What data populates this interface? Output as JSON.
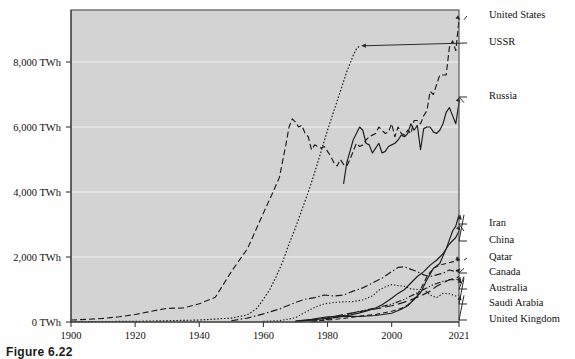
{
  "figure": {
    "caption": "Figure 6.22",
    "background": "#d3d3d3",
    "axis_color": "#3a3a3a",
    "grid_color": "#f2f2f2",
    "line_color": "#1c1c1c"
  },
  "chart_data": {
    "type": "line",
    "title": "",
    "subtitle": "",
    "xlabel": "",
    "ylabel": "",
    "xlim": [
      1900,
      2021
    ],
    "ylim": [
      0,
      9600
    ],
    "grid": true,
    "legend_position": "right-annotations",
    "x_tick_labels": [
      "1900",
      "1920",
      "1940",
      "1960",
      "1980",
      "2000",
      "2021"
    ],
    "x_ticks": [
      1900,
      1920,
      1940,
      1960,
      1980,
      2000,
      2021
    ],
    "y_tick_labels": [
      "0 TWh",
      "2,000 TWh",
      "4,000 TWh",
      "6,000 TWh",
      "8,000 TWh"
    ],
    "y_ticks": [
      0,
      2000,
      4000,
      6000,
      8000
    ],
    "series": [
      {
        "name": "United States",
        "label": "United States",
        "style": "dashed",
        "dash": "6,3",
        "width": 1.2,
        "x": [
          1900,
          1905,
          1910,
          1915,
          1920,
          1925,
          1930,
          1935,
          1940,
          1945,
          1950,
          1955,
          1960,
          1963,
          1965,
          1967,
          1968,
          1969,
          1970,
          1971,
          1972,
          1973,
          1974,
          1975,
          1976,
          1977,
          1978,
          1979,
          1980,
          1981,
          1982,
          1983,
          1984,
          1985,
          1986,
          1987,
          1988,
          1989,
          1990,
          1991,
          1992,
          1993,
          1994,
          1995,
          1996,
          1997,
          1998,
          1999,
          2000,
          2001,
          2002,
          2003,
          2004,
          2005,
          2006,
          2007,
          2008,
          2009,
          2010,
          2011,
          2012,
          2013,
          2014,
          2015,
          2016,
          2017,
          2018,
          2019,
          2020,
          2021
        ],
        "y": [
          60,
          80,
          110,
          160,
          230,
          330,
          420,
          430,
          560,
          760,
          1550,
          2250,
          3350,
          4000,
          4450,
          5450,
          6000,
          6250,
          6150,
          6000,
          6050,
          5800,
          5700,
          5300,
          5450,
          5400,
          5350,
          5400,
          5250,
          5100,
          4900,
          4800,
          5000,
          4850,
          4800,
          5000,
          5250,
          5500,
          5400,
          5450,
          5600,
          5700,
          5750,
          5800,
          6000,
          5900,
          5800,
          5850,
          6100,
          5700,
          6000,
          5800,
          5750,
          5900,
          5800,
          6200,
          6200,
          6100,
          6350,
          6500,
          7100,
          7000,
          7300,
          7600,
          7600,
          7600,
          8450,
          8650,
          8350,
          9300
        ]
      },
      {
        "name": "USSR",
        "label": "USSR",
        "style": "dotted",
        "dash": "1.6,1.8",
        "width": 1.5,
        "x": [
          1900,
          1920,
          1940,
          1950,
          1955,
          1958,
          1960,
          1962,
          1964,
          1966,
          1968,
          1970,
          1972,
          1974,
          1976,
          1978,
          1980,
          1982,
          1984,
          1986,
          1988,
          1989,
          1990
        ],
        "y": [
          10,
          20,
          60,
          120,
          220,
          420,
          700,
          1000,
          1400,
          1850,
          2400,
          2900,
          3450,
          4000,
          4600,
          5250,
          5900,
          6500,
          7100,
          7700,
          8200,
          8400,
          8500
        ]
      },
      {
        "name": "Russia",
        "label": "Russia",
        "style": "solid",
        "dash": "",
        "width": 1.3,
        "x": [
          1985,
          1986,
          1987,
          1988,
          1989,
          1990,
          1991,
          1992,
          1993,
          1994,
          1995,
          1996,
          1997,
          1998,
          1999,
          2000,
          2001,
          2002,
          2003,
          2004,
          2005,
          2006,
          2007,
          2008,
          2009,
          2010,
          2011,
          2012,
          2013,
          2014,
          2015,
          2016,
          2017,
          2018,
          2019,
          2020,
          2021
        ],
        "y": [
          4250,
          4900,
          5250,
          5600,
          5800,
          6000,
          5900,
          5500,
          5450,
          5200,
          5350,
          5500,
          5200,
          5250,
          5400,
          5450,
          5500,
          5600,
          5750,
          5700,
          5800,
          6100,
          5900,
          6050,
          5300,
          5950,
          6000,
          6000,
          5850,
          5800,
          5900,
          6100,
          6450,
          6600,
          6350,
          6100,
          6750
        ]
      },
      {
        "name": "Iran",
        "label": "Iran",
        "style": "solid",
        "dash": "",
        "width": 1.6,
        "x": [
          1970,
          1975,
          1980,
          1985,
          1990,
          1993,
          1995,
          1997,
          1999,
          2000,
          2002,
          2004,
          2006,
          2008,
          2010,
          2012,
          2014,
          2016,
          2018,
          2019,
          2020,
          2021
        ],
        "y": [
          20,
          60,
          110,
          170,
          280,
          360,
          430,
          530,
          660,
          730,
          880,
          1000,
          1200,
          1400,
          1550,
          1750,
          1900,
          2100,
          2400,
          2500,
          2600,
          2800
        ]
      },
      {
        "name": "China",
        "label": "China",
        "style": "solid",
        "dash": "",
        "width": 1.2,
        "x": [
          1970,
          1975,
          1980,
          1985,
          1990,
          1995,
          2000,
          2003,
          2005,
          2007,
          2009,
          2011,
          2013,
          2015,
          2017,
          2019,
          2020,
          2021
        ],
        "y": [
          30,
          80,
          160,
          180,
          170,
          200,
          270,
          390,
          500,
          700,
          900,
          1300,
          1650,
          1800,
          2250,
          2800,
          2950,
          3300
        ]
      },
      {
        "name": "Qatar",
        "label": "Qatar",
        "style": "dashed",
        "dash": "5,3",
        "width": 1.1,
        "x": [
          1975,
          1980,
          1985,
          1990,
          1995,
          2000,
          2003,
          2005,
          2007,
          2009,
          2011,
          2013,
          2015,
          2017,
          2019,
          2021
        ],
        "y": [
          20,
          60,
          110,
          180,
          230,
          330,
          420,
          520,
          700,
          1000,
          1400,
          1650,
          1750,
          1800,
          1850,
          1900
        ]
      },
      {
        "name": "Canada",
        "label": "Canada",
        "style": "dashdot",
        "dash": "7,2.5,1.5,2.5",
        "width": 1.2,
        "x": [
          1950,
          1955,
          1960,
          1965,
          1970,
          1973,
          1976,
          1979,
          1982,
          1985,
          1988,
          1991,
          1994,
          1997,
          2000,
          2002,
          2004,
          2006,
          2008,
          2010,
          2012,
          2014,
          2016,
          2018,
          2020,
          2021
        ],
        "y": [
          40,
          120,
          250,
          400,
          600,
          700,
          750,
          830,
          800,
          830,
          950,
          1050,
          1200,
          1350,
          1550,
          1680,
          1700,
          1620,
          1550,
          1450,
          1400,
          1450,
          1500,
          1600,
          1550,
          1650
        ]
      },
      {
        "name": "Australia",
        "label": "Australia",
        "style": "longdash",
        "dash": "9,4",
        "width": 1.1,
        "x": [
          1970,
          1975,
          1980,
          1985,
          1990,
          1995,
          2000,
          2003,
          2006,
          2009,
          2012,
          2014,
          2016,
          2018,
          2020,
          2021
        ],
        "y": [
          10,
          60,
          130,
          230,
          320,
          400,
          500,
          580,
          680,
          800,
          950,
          1100,
          1200,
          1300,
          1350,
          1400
        ]
      },
      {
        "name": "Saudi Arabia",
        "label": "Saudi Arabia",
        "style": "dashdotdot",
        "dash": "6,2,1.2,2,1.2,2",
        "width": 1.1,
        "x": [
          1975,
          1980,
          1985,
          1990,
          1995,
          2000,
          2004,
          2007,
          2010,
          2013,
          2016,
          2018,
          2020,
          2021
        ],
        "y": [
          20,
          80,
          200,
          330,
          430,
          550,
          700,
          850,
          1000,
          1150,
          1250,
          1300,
          1300,
          1350
        ]
      },
      {
        "name": "United Kingdom",
        "label": "United Kingdom",
        "style": "fine-dotted",
        "dash": "1.3,2",
        "width": 1.1,
        "x": [
          1960,
          1965,
          1970,
          1973,
          1976,
          1979,
          1982,
          1985,
          1988,
          1991,
          1994,
          1996,
          1998,
          2000,
          2002,
          2004,
          2006,
          2008,
          2010,
          2012,
          2014,
          2016,
          2018,
          2020,
          2021
        ],
        "y": [
          20,
          40,
          130,
          300,
          450,
          560,
          600,
          620,
          630,
          680,
          800,
          980,
          1080,
          1150,
          1120,
          1100,
          1020,
          1000,
          1010,
          830,
          750,
          880,
          870,
          800,
          820
        ]
      }
    ],
    "annotations": [
      {
        "label": "United States",
        "target_year": 2021,
        "target_value": 9300,
        "label_x": 489,
        "label_y": 16
      },
      {
        "label": "USSR",
        "target_year": 1990,
        "target_value": 8500,
        "label_x": 489,
        "label_y": 43
      },
      {
        "label": "Russia",
        "target_year": 2021,
        "target_value": 6750,
        "label_x": 489,
        "label_y": 97
      },
      {
        "label": "Iran",
        "target_year": 2021,
        "target_value": 2800,
        "label_x": 489,
        "label_y": 224
      },
      {
        "label": "China",
        "target_year": 2021,
        "target_value": 3300,
        "label_x": 489,
        "label_y": 241
      },
      {
        "label": "Qatar",
        "target_year": 2021,
        "target_value": 1900,
        "label_x": 489,
        "label_y": 258
      },
      {
        "label": "Canada",
        "target_year": 2021,
        "target_value": 1650,
        "label_x": 489,
        "label_y": 273
      },
      {
        "label": "Australia",
        "target_year": 2021,
        "target_value": 1400,
        "label_x": 489,
        "label_y": 289
      },
      {
        "label": "Saudi Arabia",
        "target_year": 2021,
        "target_value": 1350,
        "label_x": 489,
        "label_y": 304
      },
      {
        "label": "United Kingdom",
        "target_year": 2021,
        "target_value": 820,
        "label_x": 489,
        "label_y": 320
      }
    ]
  }
}
